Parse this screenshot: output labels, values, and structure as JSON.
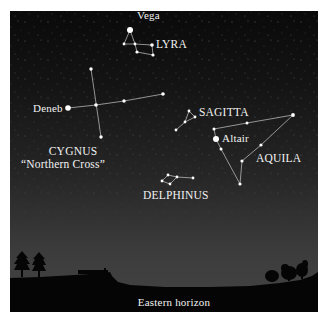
{
  "chart": {
    "colors": {
      "sky_top": "#0a0a0a",
      "sky_bottom": "#444444",
      "star": "#ffffff",
      "line": "#cfcfcf",
      "ground": "#050505",
      "label": "#f2f2f2"
    }
  },
  "labels": {
    "vega": "Vega",
    "lyra": "LYRA",
    "deneb": "Deneb",
    "cygnus": "CYGNUS",
    "cygnus_alias": "“Northern Cross”",
    "sagitta": "SAGITTA",
    "altair": "Altair",
    "aquila": "AQUILA",
    "delphinus": "DELPHINUS",
    "horizon": "Eastern horizon"
  },
  "constellations": [
    {
      "name": "LYRA",
      "bright_star": "Vega"
    },
    {
      "name": "CYGNUS",
      "alias": "Northern Cross",
      "bright_star": "Deneb"
    },
    {
      "name": "SAGITTA"
    },
    {
      "name": "AQUILA",
      "bright_star": "Altair"
    },
    {
      "name": "DELPHINUS"
    }
  ]
}
